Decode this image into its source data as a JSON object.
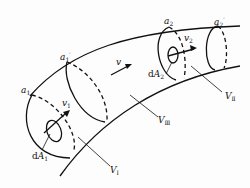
{
  "diagram": {
    "type": "curved flow tube (stream tube) with control volumes",
    "colors": {
      "stroke": "#111111",
      "background": "#fdfdfd"
    },
    "labels": {
      "a1": {
        "base": "a",
        "sub": "1",
        "sup": ""
      },
      "a1p": {
        "base": "a",
        "sub": "1",
        "sup": "′"
      },
      "a2": {
        "base": "a",
        "sub": "2",
        "sup": ""
      },
      "a2p": {
        "base": "a",
        "sub": "2",
        "sup": "′"
      },
      "v": {
        "base": "v",
        "sub": "",
        "sup": ""
      },
      "v1": {
        "base": "v",
        "sub": "1",
        "sup": ""
      },
      "v2": {
        "base": "v",
        "sub": "2",
        "sup": ""
      },
      "dA1": {
        "prefix": "d",
        "base": "A",
        "sub": "1"
      },
      "dA2": {
        "prefix": "d",
        "base": "A",
        "sub": "2"
      },
      "VI": {
        "base": "V",
        "sub": "Ⅰ"
      },
      "VII": {
        "base": "V",
        "sub": "Ⅱ"
      },
      "VIII": {
        "base": "V",
        "sub": "Ⅲ"
      }
    }
  }
}
